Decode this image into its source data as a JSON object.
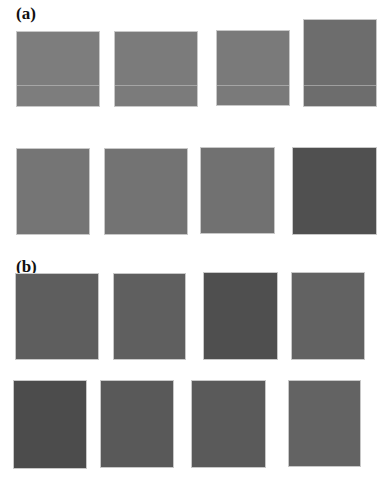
{
  "figure": {
    "panel_a": {
      "label": "(a)",
      "swatches": [
        {
          "color": "#7d7d7d"
        },
        {
          "color": "#7b7b7b"
        },
        {
          "color": "#7a7a7a"
        },
        {
          "color": "#6d6d6d"
        },
        {
          "color": "#757575"
        },
        {
          "color": "#737373"
        },
        {
          "color": "#717171"
        },
        {
          "color": "#505050"
        }
      ]
    },
    "panel_b": {
      "label": "(b)",
      "swatches": [
        {
          "color": "#5e5e5e"
        },
        {
          "color": "#5f5f5f"
        },
        {
          "color": "#4f4f4f"
        },
        {
          "color": "#626262"
        },
        {
          "color": "#4c4c4c"
        },
        {
          "color": "#595959"
        },
        {
          "color": "#5a5a5a"
        },
        {
          "color": "#636363"
        }
      ]
    }
  }
}
